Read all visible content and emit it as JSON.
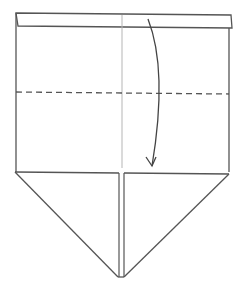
{
  "diagram": {
    "type": "origami-fold-step",
    "colors": {
      "background": "#ffffff",
      "outline": "#555555",
      "crease": "#b0b0b0",
      "dash": "#555555",
      "arrow": "#444444"
    },
    "elements": {
      "top_strip": "folded-strip",
      "center_crease": "vertical-crease",
      "fold_line": "valley-fold-dashed",
      "arrow": "fold-down-arrow",
      "bottom_flaps": [
        "left-triangle-flap",
        "right-triangle-flap"
      ]
    }
  }
}
